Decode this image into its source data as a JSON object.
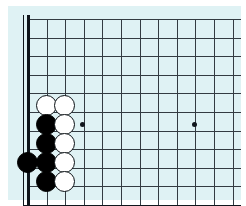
{
  "app": {
    "title": "Go Board Diagram",
    "kind": "go-board-corner-diagram"
  },
  "colors": {
    "page_background": "#ffffff",
    "board_background": "#dff2f4",
    "grid_line": "#333b42",
    "border_line": "#10161c",
    "black_stone": "#000000",
    "white_stone": "#ffffff",
    "white_stone_outline": "#0b1115"
  },
  "board": {
    "corner": "bottom-left",
    "visible_columns": 12,
    "visible_rows": 10,
    "grid_spacing_px": 18.6,
    "origin_x_px": 28,
    "origin_y_px": 19,
    "left_edge_is_border": true,
    "bottom_edge_is_border": true,
    "right_edge_is_border": false,
    "top_edge_is_border": false,
    "star_points": [
      {
        "label": "hoshi-left",
        "col": 3,
        "row": 5.5,
        "x": 82,
        "y": 124
      },
      {
        "label": "hoshi-right",
        "col": 9,
        "row": 5.5,
        "x": 194,
        "y": 124
      }
    ]
  },
  "stones": [
    {
      "id": "w1",
      "color": "white",
      "col": 1,
      "row": 4.5,
      "x": 46,
      "y": 105
    },
    {
      "id": "w2",
      "color": "white",
      "col": 2,
      "row": 4.5,
      "x": 64,
      "y": 105
    },
    {
      "id": "b1",
      "color": "black",
      "col": 1,
      "row": 5.5,
      "x": 46,
      "y": 124
    },
    {
      "id": "w3",
      "color": "white",
      "col": 2,
      "row": 5.5,
      "x": 64,
      "y": 124
    },
    {
      "id": "b2",
      "color": "black",
      "col": 1,
      "row": 6.5,
      "x": 46,
      "y": 143
    },
    {
      "id": "w4",
      "color": "white",
      "col": 2,
      "row": 6.5,
      "x": 64,
      "y": 143
    },
    {
      "id": "b3",
      "color": "black",
      "col": 0,
      "row": 7.5,
      "x": 27,
      "y": 162
    },
    {
      "id": "b4",
      "color": "black",
      "col": 1,
      "row": 7.5,
      "x": 46,
      "y": 162
    },
    {
      "id": "w5",
      "color": "white",
      "col": 2,
      "row": 7.5,
      "x": 64,
      "y": 162
    },
    {
      "id": "b5",
      "color": "black",
      "col": 1,
      "row": 8.5,
      "x": 46,
      "y": 181
    },
    {
      "id": "w6",
      "color": "white",
      "col": 2,
      "row": 8.5,
      "x": 64,
      "y": 181
    }
  ],
  "counts": {
    "black_stones": 5,
    "white_stones": 6,
    "total_stones": 11
  }
}
